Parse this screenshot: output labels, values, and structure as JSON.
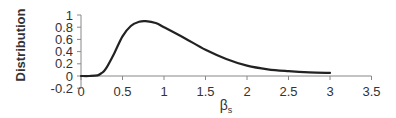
{
  "chart_data": {
    "type": "line",
    "title": "",
    "xlabel": "βₛ",
    "xlabel_base": "β",
    "xlabel_sub": "s",
    "ylabel": "Distribution",
    "xlim": [
      0,
      3.5
    ],
    "ylim": [
      -0.2,
      1
    ],
    "x_ticks": [
      "0",
      "0.5",
      "1",
      "1.5",
      "2",
      "2.5",
      "3",
      "3.5"
    ],
    "y_ticks": [
      "-0.2",
      "0",
      "0.2",
      "0.4",
      "0.6",
      "0.8",
      "1"
    ],
    "grid": false,
    "legend": null,
    "series": [
      {
        "name": "Distribution",
        "x": [
          0,
          0.1,
          0.2,
          0.25,
          0.3,
          0.4,
          0.5,
          0.6,
          0.7,
          0.78,
          0.9,
          1.0,
          1.25,
          1.5,
          1.75,
          2.0,
          2.25,
          2.5,
          2.75,
          3.0
        ],
        "values": [
          0,
          0,
          0.01,
          0.05,
          0.12,
          0.37,
          0.65,
          0.82,
          0.89,
          0.9,
          0.87,
          0.8,
          0.62,
          0.43,
          0.28,
          0.17,
          0.11,
          0.08,
          0.06,
          0.05
        ]
      }
    ],
    "colors": {
      "line": "#222222",
      "axis": "#888888",
      "text": "#333333"
    }
  }
}
